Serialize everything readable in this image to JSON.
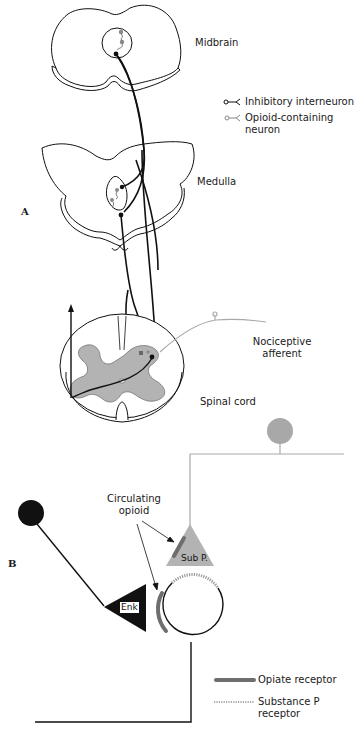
{
  "figure": {
    "panels": [
      {
        "letter": "A",
        "description": "Descending opioid pain-modulation pathway: midbrain, medulla, spinal cord"
      },
      {
        "letter": "B",
        "description": "Synaptic detail: enkephalin interneuron, substance P terminal, opiate receptors"
      }
    ]
  },
  "panel_a": {
    "letter": "A",
    "labels": {
      "midbrain": "Midbrain",
      "medulla": "Medulla",
      "nociceptive_afferent_line1": "Nociceptive",
      "nociceptive_afferent_line2": "afferent",
      "spinal_cord": "Spinal cord"
    },
    "legend": {
      "inhibitory_interneuron": "Inhibitory interneuron",
      "opioid_neuron_line1": "Opioid-containing",
      "opioid_neuron_line2": "neuron"
    }
  },
  "panel_b": {
    "letter": "B",
    "labels": {
      "circulating_opioid_line1": "Circulating",
      "circulating_opioid_line2": "opioid",
      "substance_p_terminal": "Sub P.",
      "enkephalin_terminal": "Enk"
    },
    "legend": {
      "opiate_receptor": "Opiate receptor",
      "substance_p_receptor_line1": "Substance P",
      "substance_p_receptor_line2": "receptor"
    }
  },
  "colors": {
    "line": "#111111",
    "gray_fill": "#b3b3b3",
    "receptor": "#6e6e6e",
    "afferent": "#a8a8a8",
    "dots": "#888888"
  },
  "icons": {
    "inhibitory_interneuron_symbol": "open-circle-fork",
    "opioid_neuron_symbol": "gray-circle-fork"
  }
}
